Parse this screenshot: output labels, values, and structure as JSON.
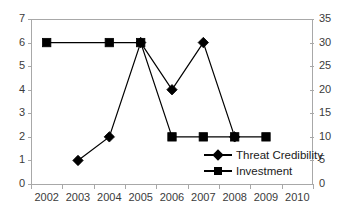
{
  "chart_data": {
    "type": "line",
    "title": "",
    "subtitle": "",
    "xlabel": "",
    "ylabel": "",
    "grid": false,
    "legend_position": "inside-bottom-right",
    "x": [
      "2002",
      "2003",
      "2004",
      "2005",
      "2006",
      "2007",
      "2008",
      "2009",
      "2010"
    ],
    "xtick_labels": [
      "2002",
      "2003",
      "2004",
      "2005",
      "2006",
      "2007",
      "2008",
      "2009",
      "2010"
    ],
    "left_axis": {
      "label": "",
      "ylim": [
        0,
        7
      ],
      "ticks": [
        0,
        1,
        2,
        3,
        4,
        5,
        6,
        7
      ],
      "tick_labels": [
        "0",
        "1",
        "2",
        "3",
        "4",
        "5",
        "6",
        "7"
      ]
    },
    "right_axis": {
      "label": "",
      "ylim": [
        0,
        35
      ],
      "ticks": [
        0,
        5,
        10,
        15,
        20,
        25,
        30,
        35
      ],
      "tick_labels": [
        "0",
        "5",
        "10",
        "15",
        "20",
        "25",
        "30",
        "35"
      ]
    },
    "series": [
      {
        "name": "Threat Credibility",
        "marker": "diamond",
        "axis": "left",
        "color": "#000000",
        "points": [
          {
            "x": "2003",
            "y": 1
          },
          {
            "x": "2004",
            "y": 2
          },
          {
            "x": "2005",
            "y": 6
          },
          {
            "x": "2006",
            "y": 4
          },
          {
            "x": "2007",
            "y": 6
          },
          {
            "x": "2008",
            "y": 2
          }
        ]
      },
      {
        "name": "Investment",
        "marker": "square",
        "axis": "right",
        "color": "#000000",
        "points": [
          {
            "x": "2002",
            "y": 30
          },
          {
            "x": "2004",
            "y": 30
          },
          {
            "x": "2005",
            "y": 30
          },
          {
            "x": "2006",
            "y": 10
          },
          {
            "x": "2007",
            "y": 10
          },
          {
            "x": "2008",
            "y": 10
          },
          {
            "x": "2009",
            "y": 10
          }
        ]
      }
    ],
    "legend": [
      {
        "label": "Threat Credibility",
        "marker": "diamond"
      },
      {
        "label": "Investment",
        "marker": "square"
      }
    ]
  }
}
